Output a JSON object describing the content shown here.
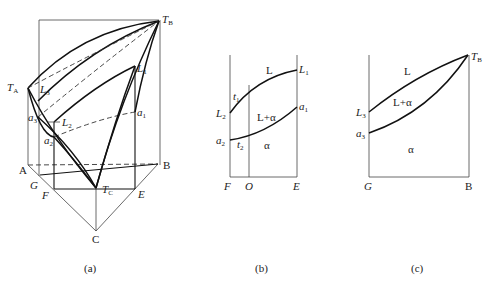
{
  "figure": {
    "panels": [
      {
        "id": "a",
        "caption": "(a)",
        "description": "Ternary isomorphous phase diagram, 3D prism view",
        "labels": {
          "TA": "T",
          "TA_sub": "A",
          "TB": "T",
          "TB_sub": "B",
          "TC": "T",
          "TC_sub": "C",
          "L1": "L",
          "L1_sub": "1",
          "L2": "L",
          "L2_sub": "2",
          "L3": "L",
          "L3_sub": "3",
          "a1": "a",
          "a1_sub": "1",
          "a2": "a",
          "a2_sub": "2",
          "a3": "a",
          "a3_sub": "3",
          "A": "A",
          "B": "B",
          "C": "C",
          "G": "G",
          "F": "F",
          "E": "E"
        }
      },
      {
        "id": "b",
        "caption": "(b)",
        "description": "Vertical section FE",
        "labels": {
          "L1": "L",
          "L1_sub": "1",
          "L2": "L",
          "L2_sub": "2",
          "a1": "a",
          "a1_sub": "1",
          "a2": "a",
          "a2_sub": "2",
          "t1": "t",
          "t1_sub": "1",
          "t2": "t",
          "t2_sub": "2",
          "region_L": "L",
          "region_L_alpha": "L+α",
          "region_alpha": "α",
          "F": "F",
          "O": "O",
          "E": "E"
        }
      },
      {
        "id": "c",
        "caption": "(c)",
        "description": "Vertical section GB",
        "labels": {
          "TB": "T",
          "TB_sub": "B",
          "L3": "L",
          "L3_sub": "3",
          "a3": "a",
          "a3_sub": "3",
          "region_L": "L",
          "region_L_alpha": "L+α",
          "region_alpha": "α",
          "G": "G",
          "B": "B"
        }
      }
    ]
  }
}
